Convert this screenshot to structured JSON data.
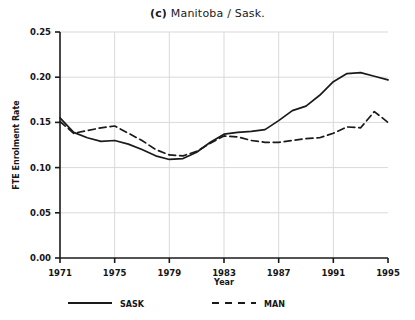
{
  "figure": {
    "panel_tag": "(c)",
    "title": "Manitoba / Sask.",
    "background_color": "#ffffff",
    "line_color": "#1a1a1a",
    "grid_color": "#d9d9d9"
  },
  "axes": {
    "y_title": "FTE Enrolment Rate",
    "x_title": "Year",
    "y_ticks": [
      "0.00",
      "0.05",
      "0.10",
      "0.15",
      "0.20",
      "0.25"
    ],
    "x_ticks": [
      "1971",
      "1975",
      "1979",
      "1983",
      "1987",
      "1991",
      "1995"
    ]
  },
  "legend": {
    "items": [
      {
        "label": "SASK",
        "style": "solid"
      },
      {
        "label": "MAN",
        "style": "dashed"
      }
    ]
  },
  "chart_data": {
    "type": "line",
    "title": "(c) Manitoba / Sask.",
    "xlabel": "Year",
    "ylabel": "FTE Enrolment Rate",
    "xlim": [
      1971,
      1995
    ],
    "ylim": [
      0.0,
      0.25
    ],
    "ytick_interval": 0.05,
    "xtick_interval": 4,
    "grid": true,
    "legend_position": "below-axes",
    "x": [
      1971,
      1972,
      1973,
      1974,
      1975,
      1976,
      1977,
      1978,
      1979,
      1980,
      1981,
      1982,
      1983,
      1984,
      1985,
      1986,
      1987,
      1988,
      1989,
      1990,
      1991,
      1992,
      1993,
      1994,
      1995
    ],
    "series": [
      {
        "name": "SASK",
        "style": "solid",
        "values": [
          0.155,
          0.139,
          0.133,
          0.129,
          0.13,
          0.126,
          0.12,
          0.113,
          0.109,
          0.11,
          0.117,
          0.128,
          0.137,
          0.139,
          0.14,
          0.142,
          0.152,
          0.163,
          0.168,
          0.18,
          0.195,
          0.204,
          0.205,
          0.201,
          0.197
        ]
      },
      {
        "name": "MAN",
        "style": "dashed",
        "values": [
          0.151,
          0.138,
          0.141,
          0.144,
          0.146,
          0.138,
          0.13,
          0.12,
          0.114,
          0.113,
          0.118,
          0.127,
          0.135,
          0.134,
          0.13,
          0.128,
          0.128,
          0.13,
          0.132,
          0.133,
          0.138,
          0.145,
          0.144,
          0.162,
          0.15
        ]
      }
    ]
  }
}
